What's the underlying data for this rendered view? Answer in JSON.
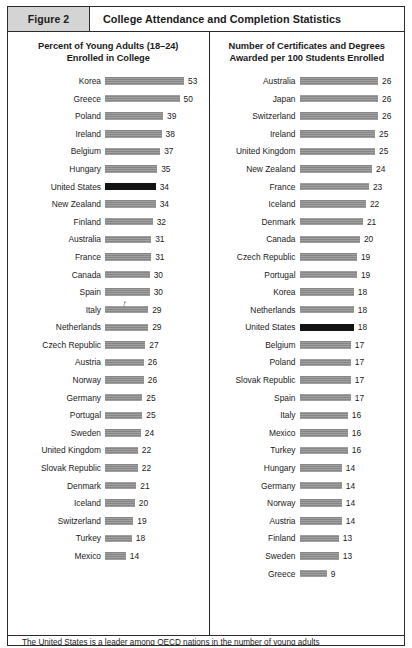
{
  "figure": {
    "tag": "Figure 2",
    "title": "College Attendance and Completion Statistics"
  },
  "footnote": {
    "text": "The United States is a leader among OECD nations in the number of young adults"
  },
  "chart_data": [
    {
      "type": "bar",
      "orientation": "horizontal",
      "title": "Percent of Young Adults (18–24)\nEnrolled in College",
      "title_line1": "Percent of Young Adults (18–24)",
      "title_line2": "Enrolled in College",
      "xlabel": "",
      "ylabel": "",
      "xlim": [
        0,
        53
      ],
      "grid": false,
      "legend": null,
      "highlight": "United States",
      "highlight_color": "#131313",
      "bar_color": "#8d8d8d",
      "categories": [
        "Korea",
        "Greece",
        "Poland",
        "Ireland",
        "Belgium",
        "Hungary",
        "United States",
        "New Zealand",
        "Finland",
        "Australia",
        "France",
        "Canada",
        "Spain",
        "Italy",
        "Netherlands",
        "Czech Republic",
        "Austria",
        "Norway",
        "Germany",
        "Portugal",
        "Sweden",
        "United Kingdom",
        "Slovak Republic",
        "Denmark",
        "Iceland",
        "Switzerland",
        "Turkey",
        "Mexico"
      ],
      "values": [
        53,
        50,
        39,
        38,
        37,
        35,
        34,
        34,
        32,
        31,
        31,
        30,
        30,
        29,
        29,
        27,
        26,
        26,
        25,
        25,
        24,
        22,
        22,
        21,
        20,
        19,
        18,
        14
      ],
      "annotations": [
        {
          "category": "Italy",
          "symbol": "ƒ"
        }
      ]
    },
    {
      "type": "bar",
      "orientation": "horizontal",
      "title": "Number of Certificates and Degrees\nAwarded per 100 Students Enrolled",
      "title_line1": "Number of Certificates and Degrees",
      "title_line2": "Awarded per 100 Students Enrolled",
      "xlabel": "",
      "ylabel": "",
      "xlim": [
        0,
        26
      ],
      "grid": false,
      "legend": null,
      "highlight": "United States",
      "highlight_color": "#131313",
      "bar_color": "#8d8d8d",
      "categories": [
        "Australia",
        "Japan",
        "Switzerland",
        "Ireland",
        "United Kingdom",
        "New Zealand",
        "France",
        "Iceland",
        "Denmark",
        "Canada",
        "Czech Republic",
        "Portugal",
        "Korea",
        "Netherlands",
        "United States",
        "Belgium",
        "Poland",
        "Slovak Republic",
        "Spain",
        "Italy",
        "Mexico",
        "Turkey",
        "Hungary",
        "Germany",
        "Norway",
        "Austria",
        "Finland",
        "Sweden",
        "Greece"
      ],
      "values": [
        26,
        26,
        26,
        25,
        25,
        24,
        23,
        22,
        21,
        20,
        19,
        19,
        18,
        18,
        18,
        17,
        17,
        17,
        17,
        16,
        16,
        16,
        14,
        14,
        14,
        14,
        13,
        13,
        9
      ]
    }
  ]
}
